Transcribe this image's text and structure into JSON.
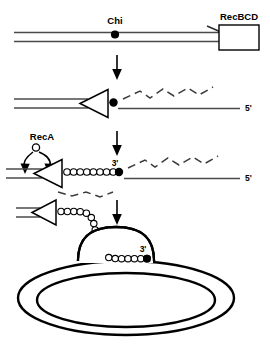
{
  "figure": {
    "background_color": "#ffffff",
    "line_color": "#000000",
    "dna_strand_color": "#3c3c3c"
  },
  "labels": {
    "chi": "Chi",
    "recbcd": "RecBCD",
    "reca": "RecA",
    "five_prime_panel2": "5'",
    "five_prime_panel3": "5'",
    "three_prime_panel3": "3'",
    "three_prime_panel4": "3'"
  },
  "panels": [
    {
      "id": "panel-1",
      "name": "duplex-dna-with-recbcd",
      "description": "Linear double-stranded DNA with Chi site marked by a filled dot; RecBCD enzyme shown as an open rectangle at the right end; arrowhead on upper strand points right toward RecBCD",
      "elements": [
        "chi-label",
        "chi-dot",
        "duplex-dna",
        "right-arrowhead",
        "recbcd-box",
        "recbcd-label"
      ]
    },
    {
      "id": "panel-2",
      "name": "recbcd-unwinding",
      "description": "RecBCD (open triangle pointing left) translocates leftward; Chi dot at triangle; a dashed zig-zag single strand loops above a straight 5' ended strand",
      "elements": [
        "duplex-dna",
        "recbcd-triangle",
        "chi-dot",
        "dashed-zigzag-strand",
        "straight-strand",
        "five-prime-label"
      ]
    },
    {
      "id": "panel-3",
      "name": "reca-loading",
      "description": "RecA protein (small open circle) is loaded onto the 3' single-stranded tail forming a chain of open circles; two curved arrows point from the RecA label down to the loading site",
      "elements": [
        "reca-label",
        "reca-circle",
        "curved-arrow-left",
        "curved-arrow-right",
        "recbcd-triangle",
        "reca-filament",
        "three-prime-label",
        "three-prime-dot",
        "dashed-zigzag-strand",
        "straight-strand",
        "five-prime-label"
      ]
    },
    {
      "id": "panel-4",
      "name": "d-loop-strand-invasion",
      "description": "The RecA-coated 3' tail invades a circular duplex DNA (two concentric ellipses) forming a displacement loop (D-loop) dome; 3' end marked with a filled dot inside the loop",
      "elements": [
        "recbcd-triangle",
        "reca-filament",
        "d-loop-dome",
        "circular-dna",
        "three-prime-label",
        "three-prime-dot"
      ]
    }
  ],
  "arrows": {
    "step_arrows": [
      {
        "name": "step-arrow-1-to-2",
        "direction": "down"
      },
      {
        "name": "step-arrow-2-to-3",
        "direction": "down"
      },
      {
        "name": "step-arrow-3-to-4",
        "direction": "down"
      }
    ]
  }
}
